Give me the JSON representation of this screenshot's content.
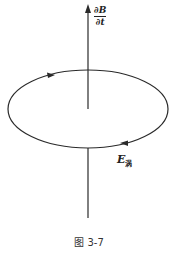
{
  "figure": {
    "caption": "图 3-7",
    "field_label": {
      "numerator": "∂B",
      "denominator": "∂t"
    },
    "loop_label": {
      "symbol": "E",
      "subscript": "涡"
    }
  },
  "colors": {
    "stroke": "#2a2a2a",
    "background": "#ffffff"
  }
}
